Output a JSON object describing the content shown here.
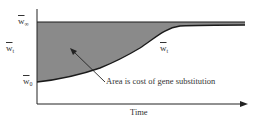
{
  "diagram": {
    "y_labels": [
      {
        "id": "w_inf",
        "main": "w",
        "sub": "∞"
      },
      {
        "id": "w_t",
        "main": "w",
        "sub": "t"
      },
      {
        "id": "w_0",
        "main": "w",
        "sub": "0"
      }
    ],
    "curve_label": {
      "main": "w",
      "sub": "t"
    },
    "annotation": "Area is cost of gene substitution",
    "x_axis_label": "Time",
    "colors": {
      "fill": "#8a8a8a",
      "line": "#1a1a1a",
      "axis": "#222222",
      "background": "#ffffff"
    }
  }
}
